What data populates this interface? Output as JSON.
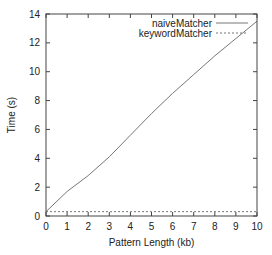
{
  "chart_data": {
    "type": "line",
    "title": "",
    "xlabel": "Pattern Length (kb)",
    "ylabel": "Time (s)",
    "xlim": [
      0,
      10
    ],
    "ylim": [
      0,
      14
    ],
    "xticks": [
      0,
      1,
      2,
      3,
      4,
      5,
      6,
      7,
      8,
      9,
      10
    ],
    "yticks": [
      0,
      2,
      4,
      6,
      8,
      10,
      12,
      14
    ],
    "grid": false,
    "legend_position": "top-right",
    "x": [
      0,
      1,
      2,
      3,
      4,
      5,
      6,
      7,
      8,
      9,
      10
    ],
    "series": [
      {
        "name": "naiveMatcher",
        "style": "solid",
        "color": "#777777",
        "values": [
          0.3,
          1.7,
          2.8,
          4.1,
          5.6,
          7.1,
          8.5,
          9.8,
          11.1,
          12.3,
          13.5
        ]
      },
      {
        "name": "keywordMatcher",
        "style": "dashed",
        "color": "#777777",
        "values": [
          0.3,
          0.3,
          0.3,
          0.3,
          0.3,
          0.3,
          0.3,
          0.3,
          0.3,
          0.3,
          0.3
        ]
      }
    ]
  }
}
